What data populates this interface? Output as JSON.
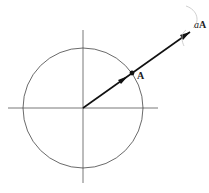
{
  "diagram": {
    "labels": {
      "point": "A",
      "scaled_prefix": "a",
      "scaled_vector": "A"
    },
    "geometry": {
      "center": [
        83,
        108
      ],
      "radius": 60,
      "point_A": [
        132,
        73
      ],
      "tip_aA": [
        190,
        32
      ]
    },
    "colors": {
      "lines": "#555555",
      "vector": "#111111",
      "arc": "#bbbbbb"
    }
  }
}
